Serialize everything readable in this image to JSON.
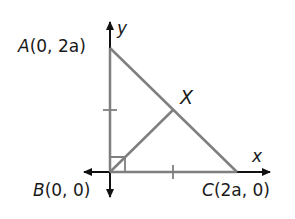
{
  "diagram": {
    "type": "coordinate-geometry",
    "axes": {
      "x_label": "x",
      "y_label": "y"
    },
    "points": {
      "A": {
        "name": "A",
        "coords": "(0, 2a)"
      },
      "B": {
        "name": "B",
        "coords": "(0, 0)"
      },
      "C": {
        "name": "C",
        "coords": "(2a, 0)"
      },
      "X": {
        "name": "X"
      }
    },
    "colors": {
      "axis": "#111111",
      "segment": "#7f7f7f"
    }
  }
}
